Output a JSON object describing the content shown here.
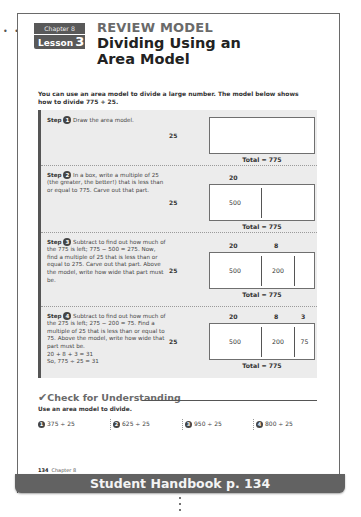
{
  "header": {
    "chapter_label": "Chapter 8",
    "lesson_label": "Lesson",
    "lesson_number": "3",
    "kicker": "REVIEW MODEL",
    "title": "Dividing Using an Area Model"
  },
  "intro": "You can use an area model to divide a large number. The model below shows how to divide 775 ÷ 25.",
  "steps": [
    {
      "label": "Step",
      "number": "1",
      "text": "Draw the area model.",
      "side_label": "25",
      "top_labels": [],
      "cells": [],
      "total": "Total = 775"
    },
    {
      "label": "Step",
      "number": "2",
      "text": "In a box, write a multiple of 25 (the greater, the better!) that is less than or equal to 775. Carve out that part.",
      "side_label": "25",
      "top_labels": [
        "20"
      ],
      "cells": [
        "500"
      ],
      "total": "Total = 775"
    },
    {
      "label": "Step",
      "number": "3",
      "text": "Subtract to find out how much of the 775 is left; 775 − 500 = 275. Now, find a multiple of 25 that is less than or equal to 275. Carve out that part. Above the model, write how wide that part must be.",
      "side_label": "25",
      "top_labels": [
        "20",
        "8"
      ],
      "cells": [
        "500",
        "200"
      ],
      "total": "Total = 775"
    },
    {
      "label": "Step",
      "number": "4",
      "text": "Subtract to find out how much of the 275 is left; 275 − 200 = 75. Find a multiple of 25 that is less than or equal to 75. Above the model, write how wide that part must be.",
      "extra_lines": [
        "20 + 8 + 3 = 31",
        "So, 775 ÷ 25 = 31"
      ],
      "side_label": "25",
      "top_labels": [
        "20",
        "8",
        "3"
      ],
      "cells": [
        "500",
        "200",
        "75"
      ],
      "total": "Total = 775"
    }
  ],
  "check": {
    "title": "Check for Understanding",
    "instruction": "Use an area model to divide.",
    "problems": [
      {
        "number": "1",
        "text": "375 ÷ 25"
      },
      {
        "number": "2",
        "text": "625 ÷ 25"
      },
      {
        "number": "3",
        "text": "950 ÷ 25"
      },
      {
        "number": "4",
        "text": "800 ÷ 25"
      }
    ]
  },
  "footer": {
    "page_number": "134",
    "chapter": "Chapter 8"
  },
  "banner": "Student Handbook p. 134",
  "colors": {
    "badge_bg": "#595959",
    "kicker": "#6a6a6a",
    "steps_bg": "#ececec",
    "banner_bg": "#626262"
  }
}
